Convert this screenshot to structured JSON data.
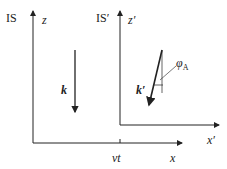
{
  "frames": {
    "IS": {
      "label": "IS",
      "z_axis": "z",
      "x_axis": "x"
    },
    "IS_prime": {
      "label": "IS′",
      "z_axis": "z′",
      "x_axis": "x′"
    }
  },
  "labels": {
    "vt": "vt",
    "k": "k",
    "k_prime": "k′",
    "phi": "φ",
    "phi_sub": "A"
  },
  "colors": {
    "line": "#222222"
  }
}
